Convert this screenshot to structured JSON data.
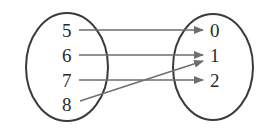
{
  "diagram": {
    "type": "mapping-diagram",
    "domain": [
      "5",
      "6",
      "7",
      "8"
    ],
    "range": [
      "0",
      "1",
      "2"
    ],
    "mappings": [
      {
        "from": "5",
        "to": "0"
      },
      {
        "from": "6",
        "to": "1"
      },
      {
        "from": "7",
        "to": "2"
      },
      {
        "from": "8",
        "to": "1"
      }
    ],
    "colors": {
      "ellipse": "#3a3a3a",
      "arrow": "#6e6e6e",
      "text": "#2a2a2a"
    }
  }
}
